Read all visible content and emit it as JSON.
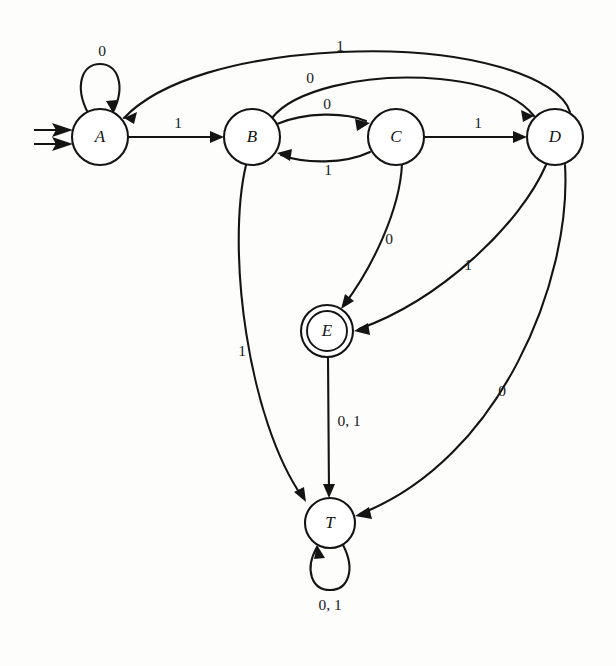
{
  "diagram": {
    "kind": "finite-state-machine",
    "alphabet": [
      "0",
      "1"
    ],
    "start_state": "A",
    "accepting_states": [
      "E"
    ],
    "trap_states": [
      "T"
    ],
    "ink_color": "#141414",
    "background_color": "#fdfdfc"
  },
  "states": [
    {
      "id": "A",
      "label": "A",
      "cx": 100,
      "cy": 137,
      "r": 28,
      "accepting": false,
      "start": true
    },
    {
      "id": "B",
      "label": "B",
      "cx": 252,
      "cy": 137,
      "r": 28,
      "accepting": false,
      "start": false
    },
    {
      "id": "C",
      "label": "C",
      "cx": 396,
      "cy": 137,
      "r": 28,
      "accepting": false,
      "start": false
    },
    {
      "id": "D",
      "label": "D",
      "cx": 555,
      "cy": 137,
      "r": 28,
      "accepting": false,
      "start": false
    },
    {
      "id": "E",
      "label": "E",
      "cx": 327,
      "cy": 331,
      "r": 26,
      "accepting": true,
      "start": false
    },
    {
      "id": "T",
      "label": "T",
      "cx": 330,
      "cy": 523,
      "r": 25,
      "accepting": false,
      "start": false
    }
  ],
  "transitions": [
    {
      "from": "A",
      "to": "A",
      "label": "0",
      "label_x": 102,
      "label_y": 52,
      "kind": "self-loop-top"
    },
    {
      "from": "A",
      "to": "B",
      "label": "1",
      "label_x": 178,
      "label_y": 124,
      "kind": "straight"
    },
    {
      "from": "B",
      "to": "C",
      "label": "0",
      "label_x": 327,
      "label_y": 105,
      "kind": "arc-above"
    },
    {
      "from": "C",
      "to": "B",
      "label": "1",
      "label_x": 328,
      "label_y": 171,
      "kind": "arc-below"
    },
    {
      "from": "C",
      "to": "D",
      "label": "1",
      "label_x": 478,
      "label_y": 124,
      "kind": "straight"
    },
    {
      "from": "B",
      "to": "D",
      "label": "0",
      "label_x": 310,
      "label_y": 79,
      "kind": "long-arc-over"
    },
    {
      "from": "D",
      "to": "A",
      "label": "1",
      "label_x": 340,
      "label_y": 47,
      "kind": "long-arc-over"
    },
    {
      "from": "C",
      "to": "E",
      "label": "0",
      "label_x": 389,
      "label_y": 240,
      "kind": "curve"
    },
    {
      "from": "D",
      "to": "E",
      "label": "1",
      "label_x": 468,
      "label_y": 266,
      "kind": "curve"
    },
    {
      "from": "B",
      "to": "T",
      "label": "1",
      "label_x": 242,
      "label_y": 352,
      "kind": "curve"
    },
    {
      "from": "E",
      "to": "T",
      "label": "0, 1",
      "label_x": 349,
      "label_y": 422,
      "kind": "straight"
    },
    {
      "from": "D",
      "to": "T",
      "label": "0",
      "label_x": 502,
      "label_y": 392,
      "kind": "curve"
    },
    {
      "from": "T",
      "to": "T",
      "label": "0, 1",
      "label_x": 330,
      "label_y": 606,
      "kind": "self-loop-bottom"
    }
  ]
}
